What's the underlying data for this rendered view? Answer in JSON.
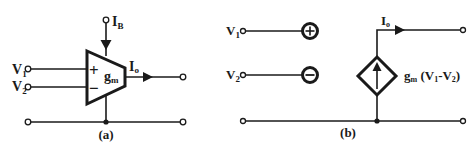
{
  "figure_a": {
    "caption": "(a)",
    "bias_current_label": "I",
    "bias_current_sub": "B",
    "input1_label": "V",
    "input1_sub": "1",
    "input2_label": "V",
    "input2_sub": "2",
    "plus_sign": "+",
    "minus_sign": "−",
    "gain_label": "g",
    "gain_sub": "m",
    "output_current_label": "I",
    "output_current_sub": "o"
  },
  "figure_b": {
    "caption": "(b)",
    "input1_label": "V",
    "input1_sub": "1",
    "input2_label": "V",
    "input2_sub": "2",
    "output_current_label": "I",
    "output_current_sub": "o",
    "source_expr_g": "g",
    "source_expr_sub": "m",
    "source_expr_open": " (V",
    "source_expr_v1sub": "1",
    "source_expr_mid": "-V",
    "source_expr_v2sub": "2",
    "source_expr_close": ")"
  },
  "colors": {
    "ink": "#1a1a1a",
    "background": "#ffffff"
  }
}
